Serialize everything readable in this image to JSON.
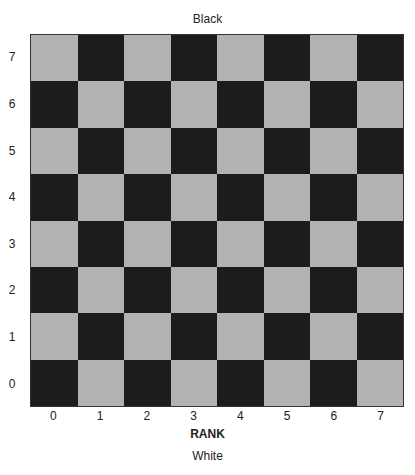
{
  "diagram": {
    "top_label": "Black",
    "bottom_label": "White",
    "axis_title": "RANK",
    "row_labels": [
      "7",
      "6",
      "5",
      "4",
      "3",
      "2",
      "1",
      "0"
    ],
    "column_labels": [
      "0",
      "1",
      "2",
      "3",
      "4",
      "5",
      "6",
      "7"
    ],
    "board": {
      "size": 8,
      "colors": {
        "light": "#b2b2b2",
        "dark": "#1c1c1c"
      },
      "pattern_note": "square at (row label y, column x) is light when (x + y) is odd"
    }
  }
}
